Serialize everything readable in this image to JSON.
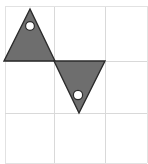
{
  "figure": {
    "title": "Two shaded triangles with circular holes on a 3 by 3 grid",
    "canvas": {
      "width": 148,
      "height": 164,
      "background": "#ffffff"
    },
    "grid": {
      "name": "three-by-three-grid",
      "rows": 3,
      "columns": 3,
      "line_color": "#d9d9d9",
      "border_color": "#e2e2e2",
      "line_width": 1,
      "x_left": 5,
      "x_right": 147,
      "y_top": 6,
      "y_bottom": 163,
      "vertical_lines_x": [
        5,
        54,
        105,
        147
      ],
      "horizontal_lines_y": [
        6,
        61,
        113,
        163
      ],
      "cell_width": 50,
      "cell_height": 52
    },
    "shapes": [
      {
        "name": "upward-triangle",
        "type": "triangle",
        "orientation": "point-up",
        "fill": "#6e6e6e",
        "stroke": "#2b2b2b",
        "stroke_width": 1.4,
        "points": "30,9 55,61 4,61",
        "vertices": [
          {
            "label": "apex",
            "x": 30,
            "y": 9
          },
          {
            "label": "base-right",
            "x": 55,
            "y": 61
          },
          {
            "label": "base-left",
            "x": 4,
            "y": 61
          }
        ],
        "hole": {
          "name": "upper-circle-hole",
          "cx": 30,
          "cy": 26,
          "r": 4.4,
          "fill": "#ffffff",
          "stroke": "#2b2b2b",
          "stroke_width": 1.2
        }
      },
      {
        "name": "downward-triangle",
        "type": "triangle",
        "orientation": "point-down",
        "fill": "#6e6e6e",
        "stroke": "#2b2b2b",
        "stroke_width": 1.4,
        "points": "54,61 105,61 79,113",
        "vertices": [
          {
            "label": "top-left",
            "x": 54,
            "y": 61
          },
          {
            "label": "top-right",
            "x": 105,
            "y": 61
          },
          {
            "label": "apex",
            "x": 79,
            "y": 113
          }
        ],
        "hole": {
          "name": "lower-circle-hole",
          "cx": 78,
          "cy": 95,
          "r": 4.6,
          "fill": "#ffffff",
          "stroke": "#2b2b2b",
          "stroke_width": 1.2
        }
      }
    ],
    "colors": {
      "shape_fill": "#6e6e6e",
      "shape_outline": "#2b2b2b",
      "hole_fill": "#ffffff",
      "grid_line": "#d9d9d9",
      "background": "#ffffff"
    }
  }
}
